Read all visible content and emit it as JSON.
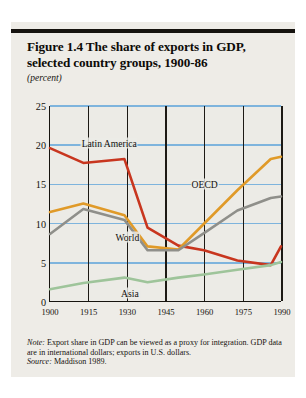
{
  "figure": {
    "title": "Figure 1.4  The share of exports in GDP, selected country groups, 1900-86",
    "subtitle": "(percent)",
    "note_label": "Note:",
    "note_text": " Export share in GDP can be viewed as a proxy for integration. GDP data are in international dollars; exports in U.S. dollars.",
    "source_label": "Source:",
    "source_text": " Maddison 1989."
  },
  "chart_data": {
    "type": "line",
    "title": "Figure 1.4  The share of exports in GDP, selected country groups, 1900-86",
    "xlabel": "",
    "ylabel": "(percent)",
    "xlim": [
      1900,
      1990
    ],
    "ylim": [
      0,
      25
    ],
    "xticks": [
      1900,
      1915,
      1930,
      1945,
      1960,
      1975,
      1990
    ],
    "yticks": [
      0,
      5,
      10,
      15,
      20,
      25
    ],
    "grid": "horizontal-blue-and-vertical-black",
    "legend": "inline-labels",
    "x": [
      1900,
      1913,
      1929,
      1938,
      1950,
      1960,
      1973,
      1986,
      1990
    ],
    "series": [
      {
        "name": "Latin America",
        "color": "#c8361f",
        "label_x": 1923,
        "label_y": 20.3,
        "values": [
          19.6,
          17.7,
          18.2,
          9.4,
          7.1,
          6.5,
          5.2,
          4.6,
          7.0
        ]
      },
      {
        "name": "OECD",
        "color": "#e09a28",
        "label_x": 1960,
        "label_y": 15.1,
        "values": [
          11.4,
          12.5,
          11.0,
          7.0,
          6.6,
          9.9,
          14.2,
          18.2,
          18.5
        ]
      },
      {
        "name": "World",
        "color": "#8f8f8a",
        "label_x": 1930,
        "label_y": 8.3,
        "values": [
          8.6,
          11.8,
          10.4,
          6.5,
          6.5,
          8.7,
          11.6,
          13.2,
          13.4
        ]
      },
      {
        "name": "Asia",
        "color": "#9ec49a",
        "label_x": 1931,
        "label_y": 1.2,
        "values": [
          1.5,
          2.3,
          3.0,
          2.4,
          3.0,
          3.4,
          4.0,
          4.6,
          5.0
        ]
      }
    ]
  }
}
